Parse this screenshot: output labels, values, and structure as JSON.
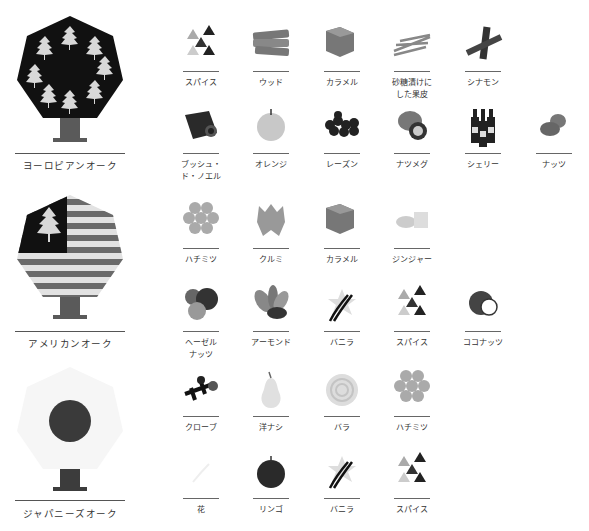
{
  "oaks": [
    {
      "name": "ヨーロピアンオーク",
      "icon": "european-oak-tree-icon",
      "flavors_row1": [
        "スパイス",
        "ウッド",
        "カラメル",
        "砂糖漬けに\nした果皮",
        "シナモン"
      ],
      "flavors_row2": [
        "ブッシュ・\nド・ノエル",
        "オレンジ",
        "レーズン",
        "ナツメグ",
        "シェリー",
        "ナッツ"
      ]
    },
    {
      "name": "アメリカンオーク",
      "icon": "american-oak-tree-icon",
      "flavors_row1": [
        "ハチミツ",
        "クルミ",
        "カラメル",
        "ジンジャー"
      ],
      "flavors_row2": [
        "ヘーゼル\nナッツ",
        "アーモンド",
        "バニラ",
        "スパイス",
        "ココナッツ"
      ]
    },
    {
      "name": "ジャパニーズオーク",
      "icon": "japanese-oak-tree-icon",
      "flavors_row1": [
        "クローブ",
        "洋ナシ",
        "バラ",
        "ハチミツ"
      ],
      "flavors_row2": [
        "花",
        "リンゴ",
        "バニラ",
        "スパイス"
      ]
    }
  ],
  "colors": {
    "dark": "#1a1a1a",
    "mid": "#555555",
    "light": "#cfcfcf",
    "trunk": "#5a5a5a"
  }
}
